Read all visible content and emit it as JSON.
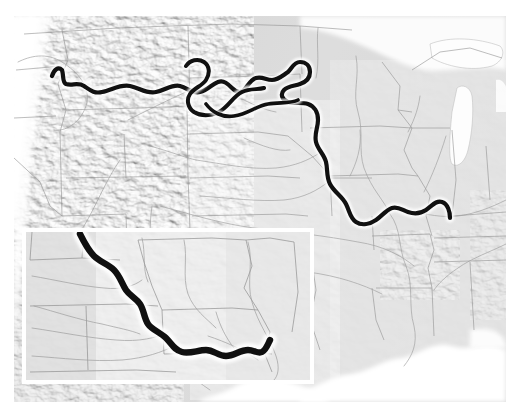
{
  "map": {
    "title": "Missouri River course over shaded-relief basemap of the central and western United States",
    "projection_note": "Albers-style conic, North America",
    "basemap_style": "grayscale shaded relief (hillshade)",
    "background_color": "#ffffff",
    "land_color": "#d8d8d8",
    "water_color": "#fefefe",
    "state_border_color": "#8a8a8a",
    "minor_river_color": "#9a9a9a",
    "highlight_river_color": "#121212",
    "highlight_river_halo_color": "#ffffff",
    "highlight_river_name": "Missouri River",
    "highlight_river_width_px": 4.2,
    "extent": {
      "left_px": 14,
      "top_px": 16,
      "right_px": 506,
      "bottom_px": 402
    },
    "labels": []
  },
  "inset": {
    "name": "detail-inset",
    "description": "Enlarged detail of the lower Missouri River through Nebraska, Iowa, Kansas and Missouri",
    "frame_color": "#ffffff",
    "frame_width_px": 4,
    "position": {
      "left_px": 22,
      "top_px": 228,
      "width_px": 292,
      "height_px": 156
    },
    "labels": []
  },
  "legend": {
    "items": []
  },
  "annotations": {
    "text": []
  }
}
